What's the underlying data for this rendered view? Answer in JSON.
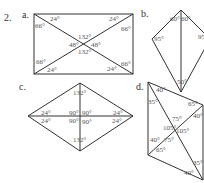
{
  "problem_number": "2.",
  "figures": {
    "a": {
      "label": "a.",
      "shape": "rectangle with diagonals",
      "angles": [
        "24°",
        "24°",
        "66°",
        "66°",
        "132°",
        "48°",
        "48°",
        "132°",
        "66°",
        "66°",
        "24°",
        "24°"
      ]
    },
    "b": {
      "label": "b.",
      "shape": "kite with diagonal",
      "angles": [
        "60°",
        "60°",
        "95°",
        "95°",
        "50°"
      ]
    },
    "c": {
      "label": "c.",
      "shape": "rhombus with diagonals",
      "angles": [
        "132°",
        "24°",
        "90°",
        "90°",
        "24°",
        "24°",
        "90°",
        "90°",
        "24°",
        "132°"
      ]
    },
    "d": {
      "label": "d.",
      "shape": "parallelogram with diagonals",
      "angles": [
        "40°",
        "35°",
        "65°",
        "75°",
        "40°",
        "105°",
        "105°",
        "40°",
        "75°",
        "65°",
        "35°",
        "40°"
      ]
    }
  }
}
